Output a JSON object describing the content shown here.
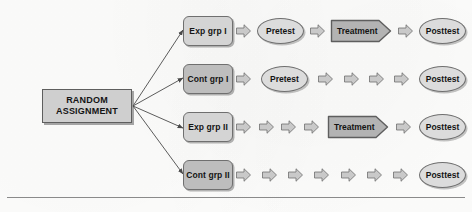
{
  "diagram": {
    "root": {
      "line1": "RANDOM",
      "line2": "ASSIGNMENT"
    },
    "colors": {
      "background": "#fdfdfc",
      "group_light_fill": "#d4d4d4",
      "group_dark_fill": "#bdbdbd",
      "oval_fill": "#dcdcdc",
      "treatment_fill": "#b3b3b3",
      "arrow_fill": "#c9c9c9",
      "outline": "#6f6f6f",
      "text": "#141414",
      "rule": "#8a8a8a"
    },
    "rows": [
      {
        "id": "row-exp-1",
        "group": {
          "label": "Exp grp I",
          "shade": "light"
        },
        "steps": [
          {
            "type": "arrow"
          },
          {
            "type": "oval",
            "label": "Pretest"
          },
          {
            "type": "arrow"
          },
          {
            "type": "treatment",
            "label": "Treatment"
          },
          {
            "type": "arrow"
          },
          {
            "type": "oval",
            "label": "Posttest"
          }
        ]
      },
      {
        "id": "row-cont-1",
        "group": {
          "label": "Cont grp I",
          "shade": "dark"
        },
        "steps": [
          {
            "type": "arrow"
          },
          {
            "type": "oval",
            "label": "Pretest"
          },
          {
            "type": "arrow"
          },
          {
            "type": "arrow"
          },
          {
            "type": "arrow"
          },
          {
            "type": "arrow"
          },
          {
            "type": "oval",
            "label": "Posttest"
          }
        ]
      },
      {
        "id": "row-exp-2",
        "group": {
          "label": "Exp grp II",
          "shade": "light"
        },
        "steps": [
          {
            "type": "arrow"
          },
          {
            "type": "arrow"
          },
          {
            "type": "arrow"
          },
          {
            "type": "arrow"
          },
          {
            "type": "treatment",
            "label": "Treatment"
          },
          {
            "type": "arrow"
          },
          {
            "type": "oval",
            "label": "Posttest"
          }
        ]
      },
      {
        "id": "row-cont-2",
        "group": {
          "label": "Cont grp II",
          "shade": "dark"
        },
        "steps": [
          {
            "type": "arrow"
          },
          {
            "type": "arrow"
          },
          {
            "type": "arrow"
          },
          {
            "type": "arrow"
          },
          {
            "type": "arrow"
          },
          {
            "type": "arrow"
          },
          {
            "type": "arrow"
          },
          {
            "type": "oval",
            "label": "Posttest"
          }
        ]
      }
    ]
  }
}
